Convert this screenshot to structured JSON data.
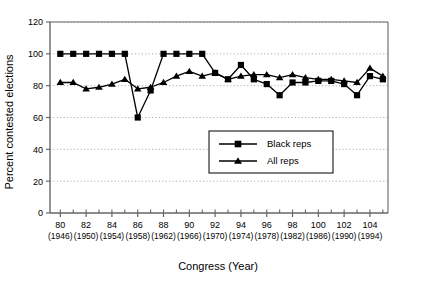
{
  "chart_data": {
    "type": "line",
    "title": "",
    "xlabel": "Congress (Year)",
    "ylabel": "Percent contested elections",
    "xlim": [
      79.2,
      105.4
    ],
    "ylim": [
      0,
      120
    ],
    "ytick_step": 20,
    "grid": true,
    "grid_axis": "y",
    "legend_position": "center",
    "x": [
      80,
      81,
      82,
      83,
      84,
      85,
      86,
      87,
      88,
      89,
      90,
      91,
      92,
      93,
      94,
      95,
      96,
      97,
      98,
      99,
      100,
      101,
      102,
      103,
      104,
      105
    ],
    "xticks": [
      80,
      82,
      84,
      86,
      88,
      90,
      92,
      94,
      96,
      98,
      100,
      102,
      104
    ],
    "xtick_labels": [
      "80",
      "82",
      "84",
      "86",
      "88",
      "90",
      "92",
      "94",
      "96",
      "98",
      "100",
      "102",
      "104"
    ],
    "xtick_sublabels": [
      "(1946)",
      "(1950)",
      "(1954)",
      "(1958)",
      "(1962)",
      "(1966)",
      "(1970)",
      "(1974)",
      "(1978)",
      "(1982)",
      "(1986)",
      "(1990)",
      "(1994)"
    ],
    "yticks": [
      0,
      20,
      40,
      60,
      80,
      100,
      120
    ],
    "ytick_labels": [
      "0",
      "20",
      "40",
      "60",
      "80",
      "100",
      "120"
    ],
    "series": [
      {
        "name": "Black reps",
        "marker": "square",
        "values": [
          100,
          100,
          100,
          100,
          100,
          100,
          60,
          77,
          100,
          100,
          100,
          100,
          88,
          84,
          93,
          84,
          81,
          74,
          82,
          82,
          83,
          83,
          81,
          74,
          86,
          84
        ]
      },
      {
        "name": "All reps",
        "marker": "triangle",
        "values": [
          82,
          82,
          78,
          79,
          81,
          84,
          78,
          79,
          82,
          86,
          89,
          86,
          88,
          84,
          86,
          87,
          87,
          85,
          87,
          85,
          84,
          84,
          83,
          82,
          91,
          86
        ]
      }
    ]
  },
  "legend": {
    "entries": [
      {
        "label": "Black reps",
        "marker": "square"
      },
      {
        "label": "All reps",
        "marker": "triangle"
      }
    ]
  },
  "colors": {
    "line": "#000000",
    "marker": "#000000",
    "grid": "#9a9a9a",
    "axis": "#666666",
    "background": "#ffffff"
  }
}
